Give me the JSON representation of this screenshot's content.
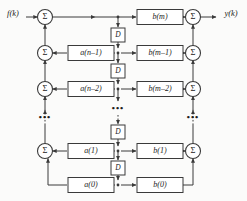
{
  "diagram": {
    "input_label": "f(k)",
    "output_label": "y(k)",
    "sum_symbol": "Σ",
    "delay_label": "D",
    "ellipsis": "•••",
    "colors": {
      "background": "#fbfbfa",
      "line": "#3a3a3a",
      "box_fill": "#ffffff",
      "text": "#1b1b1b"
    },
    "rows": [
      {
        "id": "row-m",
        "a_label": "",
        "b_label": "b(m)",
        "has_left_sum": true,
        "has_right_sum": true
      },
      {
        "id": "row-m1",
        "a_label": "a(n–1)",
        "b_label": "b(m–1)",
        "has_left_sum": true,
        "has_right_sum": true
      },
      {
        "id": "row-m2",
        "a_label": "a(n–2)",
        "b_label": "b(m–2)",
        "has_left_sum": true,
        "has_right_sum": true
      },
      {
        "id": "row-1",
        "a_label": "a(1)",
        "b_label": "b(1)",
        "has_left_sum": true,
        "has_right_sum": true
      },
      {
        "id": "row-0",
        "a_label": "a(0)",
        "b_label": "b(0)",
        "has_left_sum": false,
        "has_right_sum": false
      }
    ],
    "delays": [
      {
        "id": "delay-1",
        "label": "D"
      },
      {
        "id": "delay-2",
        "label": "D"
      },
      {
        "id": "delay-3",
        "label": "D"
      },
      {
        "id": "delay-4",
        "label": "D"
      }
    ],
    "ellipses": [
      {
        "id": "ellipsis-left",
        "text": "•••"
      },
      {
        "id": "ellipsis-center",
        "text": "•••"
      },
      {
        "id": "ellipsis-right",
        "text": "•••"
      }
    ]
  }
}
